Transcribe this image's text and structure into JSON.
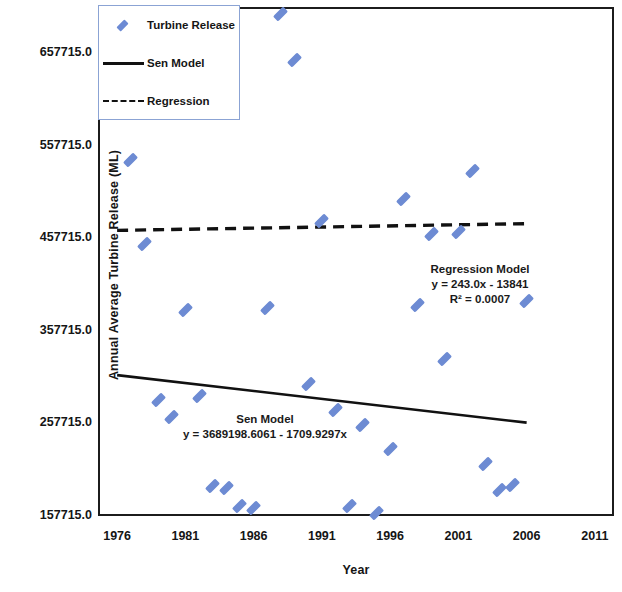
{
  "chart_data": {
    "type": "scatter",
    "title": "",
    "xlabel": "Year",
    "ylabel": "Annual Average Turbine Release (ML)",
    "xlim": [
      1974.6,
      2012.4
    ],
    "ylim": [
      157715.0,
      707715.0
    ],
    "xticks": [
      "1976",
      "1981",
      "1986",
      "1991",
      "1996",
      "2001",
      "2006",
      "2011"
    ],
    "xtick_values": [
      1976,
      1981,
      1986,
      1991,
      1996,
      2001,
      2006,
      2011
    ],
    "yticks": [
      "157715.0",
      "257715.0",
      "357715.0",
      "457715.0",
      "557715.0",
      "657715.0"
    ],
    "ytick_values": [
      157715,
      257715,
      357715,
      457715,
      557715,
      657715
    ],
    "grid": false,
    "legend_position": "top-left",
    "marker": "diamond",
    "marker_color": "#6d8bd3",
    "line_color": "#111111",
    "series": [
      {
        "name": "Turbine Release",
        "type": "scatter",
        "x": [
          1977,
          1978,
          1979,
          1980,
          1981,
          1982,
          1983,
          1984,
          1985,
          1986,
          1987,
          1988,
          1989,
          1990,
          1991,
          1992,
          1993,
          1994,
          1995,
          1996,
          1997,
          1998,
          1999,
          2000,
          2001,
          2002,
          2003,
          2004,
          2005,
          2006
        ],
        "y": [
          542000,
          452000,
          283000,
          265000,
          380000,
          287000,
          190000,
          188000,
          168000,
          166000,
          382000,
          700000,
          650000,
          300000,
          477000,
          272000,
          168000,
          256000,
          161000,
          230000,
          500000,
          386000,
          462000,
          327000,
          465000,
          530000,
          214000,
          186000,
          191000,
          390000
        ]
      },
      {
        "name": "Sen Model",
        "type": "line",
        "equation": "y = 3689198.6061 - 1709.9297x",
        "slope": -1709.9297,
        "intercept": 3689198.6061,
        "x_endpoints": [
          1976.0,
          2006.0
        ],
        "y_endpoints": [
          309903.7,
          258605.8
        ]
      },
      {
        "name": "Regression",
        "type": "line",
        "style": "dashed",
        "equation": "y = 243.0x - 13841",
        "slope": 243.0,
        "intercept": -13841,
        "r_squared": 0.0007,
        "x_endpoints": [
          1976.0,
          2006.0
        ],
        "y_endpoints": [
          466327.0,
          473617.0
        ]
      }
    ],
    "annotations": [
      {
        "name": "regression-annotation",
        "lines": [
          "Regression Model",
          "y = 243.0x - 13841",
          "R² = 0.0007"
        ],
        "x": 2000.0,
        "y": 420000
      },
      {
        "name": "sen-annotation",
        "lines": [
          "Sen Model",
          "y = 3689198.6061 - 1709.9297x"
        ],
        "x": 1989.0,
        "y": 245000
      }
    ]
  },
  "legend": {
    "items": [
      {
        "label": "Turbine Release",
        "key": "diamond"
      },
      {
        "label": "Sen Model",
        "key": "solid-line"
      },
      {
        "label": "Regression",
        "key": "dashed-line"
      }
    ]
  },
  "axes": {
    "y_title": "Annual Average Turbine Release (ML)",
    "x_title": "Year"
  },
  "annotation_regression": {
    "line1": "Regression Model",
    "line2": "y = 243.0x - 13841",
    "line3": "R² = 0.0007"
  },
  "annotation_sen": {
    "line1": "Sen Model",
    "line2": "y = 3689198.6061 - 1709.9297x"
  }
}
